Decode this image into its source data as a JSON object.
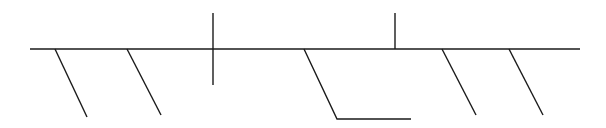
{
  "diagram": {
    "type": "fishbone-skeleton",
    "stroke_color": "#1a1a1a",
    "background": "#ffffff",
    "spine": {
      "x1": 30,
      "y1": 49,
      "x2": 580,
      "y2": 49
    },
    "verticals": [
      {
        "id": "cross-vertical",
        "x1": 213,
        "y1": 13,
        "x2": 213,
        "y2": 85
      },
      {
        "id": "upper-vertical",
        "x1": 395,
        "y1": 13,
        "x2": 395,
        "y2": 49
      }
    ],
    "diagonals": [
      {
        "id": "diag-1",
        "x1": 55,
        "y1": 49,
        "x2": 87,
        "y2": 117
      },
      {
        "id": "diag-2",
        "x1": 127,
        "y1": 49,
        "x2": 161,
        "y2": 115
      },
      {
        "id": "diag-4",
        "x1": 442,
        "y1": 49,
        "x2": 476,
        "y2": 115
      },
      {
        "id": "diag-5",
        "x1": 509,
        "y1": 49,
        "x2": 543,
        "y2": 115
      }
    ],
    "hooked_branch": {
      "points": "304,49 337,119 411,119"
    }
  }
}
